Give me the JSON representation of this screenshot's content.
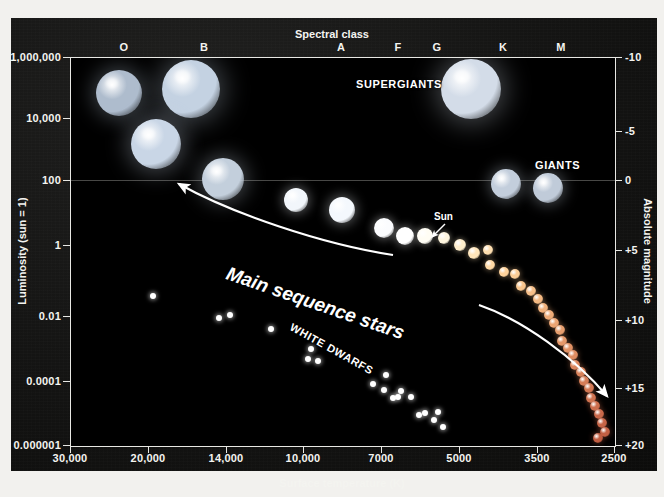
{
  "figure": {
    "background_color": "#f2f1ee",
    "panel_color": "#141413",
    "plot_background": "#000000",
    "axis_color": "#e8e8e4",
    "text_color": "#f4f4f0"
  },
  "axes": {
    "top": {
      "title": "Spectral class",
      "ticks": [
        {
          "label": "O",
          "x_px": 124
        },
        {
          "label": "B",
          "x_px": 204
        },
        {
          "label": "A",
          "x_px": 341
        },
        {
          "label": "F",
          "x_px": 398
        },
        {
          "label": "G",
          "x_px": 437
        },
        {
          "label": "K",
          "x_px": 503
        },
        {
          "label": "M",
          "x_px": 561
        }
      ]
    },
    "bottom": {
      "title": "Surface temperature (K)",
      "ticks": [
        {
          "label": "30,000",
          "x_px": 70
        },
        {
          "label": "20,000",
          "x_px": 148
        },
        {
          "label": "14,000",
          "x_px": 226
        },
        {
          "label": "10,000",
          "x_px": 303
        },
        {
          "label": "7000",
          "x_px": 381
        },
        {
          "label": "5000",
          "x_px": 459
        },
        {
          "label": "3500",
          "x_px": 537
        },
        {
          "label": "2500",
          "x_px": 614
        }
      ]
    },
    "left": {
      "title": "Luminosity (sun = 1)",
      "ticks": [
        {
          "label": "1,000,000",
          "y_px": 57
        },
        {
          "label": "10,000",
          "y_px": 118
        },
        {
          "label": "100",
          "y_px": 180
        },
        {
          "label": "1",
          "y_px": 245
        },
        {
          "label": "0.01",
          "y_px": 316
        },
        {
          "label": "0.0001",
          "y_px": 381
        },
        {
          "label": "0.000001",
          "y_px": 445
        }
      ]
    },
    "right": {
      "title": "Absolute magnitude",
      "ticks": [
        {
          "label": "-10",
          "y_px": 57
        },
        {
          "label": "-5",
          "y_px": 131
        },
        {
          "label": "0",
          "y_px": 180
        },
        {
          "label": "+5",
          "y_px": 250
        },
        {
          "label": "+10",
          "y_px": 320
        },
        {
          "label": "+15",
          "y_px": 388
        },
        {
          "label": "+20",
          "y_px": 445
        }
      ]
    }
  },
  "annotations": {
    "supergiants": "SUPERGIANTS",
    "giants": "GIANTS",
    "main_sequence": "Main sequence stars",
    "white_dwarfs": "WHITE DWARFS",
    "sun": "Sun"
  },
  "chart_data": {
    "type": "scatter",
    "xlabel": "Surface temperature (K)",
    "ylabel": "Luminosity (sun = 1)",
    "x2label": "Spectral class",
    "y2label": "Absolute magnitude",
    "xlim": [
      30000,
      2500
    ],
    "ylim": [
      1e-06,
      1000000
    ],
    "xscale": "reversed-temperature",
    "yscale": "log",
    "grid": "single horizontal line at luminosity 100",
    "legend": "none (inline region labels)",
    "series": [
      {
        "name": "Supergiants",
        "color": "#b9c6d4",
        "points": [
          {
            "x_px": 118,
            "y_px": 92,
            "r": 23,
            "color": "#aebccd"
          },
          {
            "x_px": 190,
            "y_px": 88,
            "r": 29,
            "color": "#c4d2e2"
          },
          {
            "x_px": 155,
            "y_px": 143,
            "r": 25,
            "color": "#c9d6e6"
          },
          {
            "x_px": 222,
            "y_px": 178,
            "r": 21,
            "color": "#c3cfdc"
          },
          {
            "x_px": 470,
            "y_px": 88,
            "r": 30,
            "color": "#d3dce8"
          }
        ]
      },
      {
        "name": "Giants",
        "color": "#cdd6e0",
        "points": [
          {
            "x_px": 505,
            "y_px": 183,
            "r": 15,
            "color": "#c3cedc"
          },
          {
            "x_px": 547,
            "y_px": 187,
            "r": 15,
            "color": "#c0cbd9"
          }
        ]
      },
      {
        "name": "Main sequence stars",
        "color": "#ffffff",
        "points": [
          {
            "x_px": 295,
            "y_px": 199,
            "r": 12,
            "color": "#f2f6fb"
          },
          {
            "x_px": 341,
            "y_px": 209,
            "r": 13,
            "color": "#f4f8fd"
          },
          {
            "x_px": 383,
            "y_px": 227,
            "r": 10,
            "color": "#fbfcfe"
          },
          {
            "x_px": 404,
            "y_px": 235,
            "r": 9,
            "color": "#ffffff"
          },
          {
            "x_px": 424,
            "y_px": 235,
            "r": 8,
            "color": "#fffdf4"
          },
          {
            "x_px": 443,
            "y_px": 237,
            "r": 6,
            "color": "#fff6df"
          },
          {
            "x_px": 459,
            "y_px": 244,
            "r": 6,
            "color": "#ffeecb"
          },
          {
            "x_px": 473,
            "y_px": 252,
            "r": 6,
            "color": "#ffe6bb"
          },
          {
            "x_px": 487,
            "y_px": 249,
            "r": 5,
            "color": "#ffdfb0"
          },
          {
            "x_px": 489,
            "y_px": 264,
            "r": 5,
            "color": "#ffd9a5"
          },
          {
            "x_px": 503,
            "y_px": 271,
            "r": 5,
            "color": "#ffd39c"
          },
          {
            "x_px": 514,
            "y_px": 273,
            "r": 5,
            "color": "#fccd96"
          },
          {
            "x_px": 520,
            "y_px": 285,
            "r": 5,
            "color": "#f9c68e"
          },
          {
            "x_px": 530,
            "y_px": 290,
            "r": 5,
            "color": "#f7c08a"
          },
          {
            "x_px": 537,
            "y_px": 298,
            "r": 5,
            "color": "#f4b983"
          },
          {
            "x_px": 542,
            "y_px": 307,
            "r": 5,
            "color": "#f1b27d"
          },
          {
            "x_px": 548,
            "y_px": 314,
            "r": 5,
            "color": "#eeac78"
          },
          {
            "x_px": 553,
            "y_px": 322,
            "r": 5,
            "color": "#eba573"
          },
          {
            "x_px": 559,
            "y_px": 329,
            "r": 5,
            "color": "#e89f6e"
          },
          {
            "x_px": 561,
            "y_px": 340,
            "r": 5,
            "color": "#e5996a"
          },
          {
            "x_px": 567,
            "y_px": 347,
            "r": 5,
            "color": "#e29366"
          },
          {
            "x_px": 572,
            "y_px": 354,
            "r": 5,
            "color": "#df8d62"
          },
          {
            "x_px": 574,
            "y_px": 364,
            "r": 5,
            "color": "#dc875e"
          },
          {
            "x_px": 580,
            "y_px": 371,
            "r": 5,
            "color": "#d9825a"
          },
          {
            "x_px": 583,
            "y_px": 380,
            "r": 5,
            "color": "#d67d57"
          },
          {
            "x_px": 588,
            "y_px": 387,
            "r": 5,
            "color": "#d37853"
          },
          {
            "x_px": 590,
            "y_px": 397,
            "r": 5,
            "color": "#d07350"
          },
          {
            "x_px": 594,
            "y_px": 405,
            "r": 5,
            "color": "#cd6e4d"
          },
          {
            "x_px": 598,
            "y_px": 413,
            "r": 5,
            "color": "#ca694a"
          },
          {
            "x_px": 601,
            "y_px": 422,
            "r": 5,
            "color": "#c76547"
          },
          {
            "x_px": 604,
            "y_px": 431,
            "r": 5,
            "color": "#c46144"
          },
          {
            "x_px": 597,
            "y_px": 437,
            "r": 5,
            "color": "#c15d41"
          }
        ]
      },
      {
        "name": "White dwarfs",
        "color": "#ffffff",
        "points": [
          {
            "x_px": 152,
            "y_px": 295,
            "r": 3,
            "color": "#ffffff"
          },
          {
            "x_px": 218,
            "y_px": 317,
            "r": 3,
            "color": "#ffffff"
          },
          {
            "x_px": 229,
            "y_px": 314,
            "r": 3,
            "color": "#ffffff"
          },
          {
            "x_px": 270,
            "y_px": 328,
            "r": 3,
            "color": "#ffffff"
          },
          {
            "x_px": 310,
            "y_px": 348,
            "r": 3,
            "color": "#ffffff"
          },
          {
            "x_px": 307,
            "y_px": 358,
            "r": 3,
            "color": "#ffffff"
          },
          {
            "x_px": 317,
            "y_px": 360,
            "r": 3,
            "color": "#ffffff"
          },
          {
            "x_px": 372,
            "y_px": 383,
            "r": 3,
            "color": "#ffffff"
          },
          {
            "x_px": 383,
            "y_px": 389,
            "r": 3,
            "color": "#ffffff"
          },
          {
            "x_px": 385,
            "y_px": 374,
            "r": 3,
            "color": "#ffffff"
          },
          {
            "x_px": 392,
            "y_px": 397,
            "r": 3,
            "color": "#ffffff"
          },
          {
            "x_px": 397,
            "y_px": 396,
            "r": 3,
            "color": "#ffffff"
          },
          {
            "x_px": 400,
            "y_px": 390,
            "r": 3,
            "color": "#ffffff"
          },
          {
            "x_px": 410,
            "y_px": 396,
            "r": 3,
            "color": "#ffffff"
          },
          {
            "x_px": 418,
            "y_px": 414,
            "r": 3,
            "color": "#ffffff"
          },
          {
            "x_px": 424,
            "y_px": 412,
            "r": 3,
            "color": "#ffffff"
          },
          {
            "x_px": 433,
            "y_px": 419,
            "r": 3,
            "color": "#ffffff"
          },
          {
            "x_px": 437,
            "y_px": 411,
            "r": 3,
            "color": "#ffffff"
          },
          {
            "x_px": 442,
            "y_px": 426,
            "r": 3,
            "color": "#ffffff"
          }
        ]
      }
    ],
    "arrows": [
      {
        "name": "main-sequence-upper-arrow",
        "from_px": [
          322,
          197
        ],
        "to_px": [
          105,
          123
        ],
        "direction": "up-left"
      },
      {
        "name": "main-sequence-lower-arrow",
        "from_px": [
          408,
          247
        ],
        "to_px": [
          540,
          342
        ],
        "direction": "down-right"
      },
      {
        "name": "sun-pointer-arrow",
        "from_px": [
          374,
          166
        ],
        "to_px": [
          359,
          181
        ],
        "direction": "down-left"
      }
    ]
  }
}
